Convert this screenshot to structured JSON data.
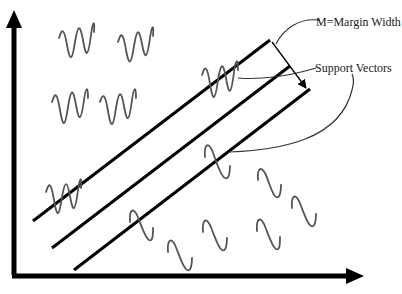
{
  "diagram": {
    "type": "svm-margin-illustration",
    "annotations": {
      "margin": "M=Margin Width",
      "support_vectors": "Support Vectors"
    },
    "colors": {
      "background": "#ffffff",
      "axes": "#000000",
      "lines": "#000000",
      "waves": "#555555",
      "text": "#1a1a1a"
    },
    "axes": {
      "y_axis": {
        "x": 14,
        "y_top": 12,
        "y_bottom": 275
      },
      "x_axis": {
        "y": 276,
        "x_left": 12,
        "x_right": 362
      }
    },
    "hyperplanes": [
      {
        "name": "upper-margin-line",
        "x1": 33,
        "y1": 221,
        "x2": 270,
        "y2": 40
      },
      {
        "name": "decision-boundary-line",
        "x1": 52,
        "y1": 248,
        "x2": 290,
        "y2": 66
      },
      {
        "name": "lower-margin-line",
        "x1": 74,
        "y1": 270,
        "x2": 310,
        "y2": 89
      }
    ],
    "class_a_samples": [
      {
        "x": 58,
        "y": 20,
        "w": 36,
        "h": 46
      },
      {
        "x": 117,
        "y": 22,
        "w": 37,
        "h": 48
      },
      {
        "x": 51,
        "y": 84,
        "w": 38,
        "h": 47
      },
      {
        "x": 99,
        "y": 84,
        "w": 38,
        "h": 48
      },
      {
        "x": 201,
        "y": 55,
        "w": 38,
        "h": 48
      },
      {
        "x": 45,
        "y": 175,
        "w": 36,
        "h": 46
      }
    ],
    "class_b_samples": [
      {
        "x": 203,
        "y": 143,
        "w": 28,
        "h": 38
      },
      {
        "x": 129,
        "y": 208,
        "w": 25,
        "h": 34
      },
      {
        "x": 167,
        "y": 237,
        "w": 26,
        "h": 36
      },
      {
        "x": 257,
        "y": 166,
        "w": 25,
        "h": 33
      },
      {
        "x": 291,
        "y": 193,
        "w": 26,
        "h": 35
      },
      {
        "x": 202,
        "y": 218,
        "w": 26,
        "h": 35
      },
      {
        "x": 256,
        "y": 217,
        "w": 25,
        "h": 35
      }
    ]
  }
}
